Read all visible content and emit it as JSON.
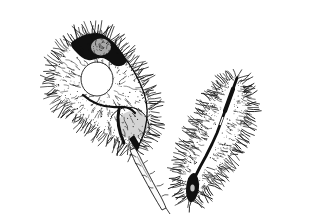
{
  "canvas": {
    "width": "228",
    "height": "200",
    "background_color": "#ffffff"
  },
  "figure": {
    "type": "botanical-ink-illustration",
    "ink_color": "#101010",
    "elements": {
      "left_pod": "broad hairy pod with seed bulges and stalk",
      "right_pod": "slender hairy pod viewed edge-on with dark central suture",
      "stalk": "curved pedicel extending from the left pod base"
    }
  }
}
